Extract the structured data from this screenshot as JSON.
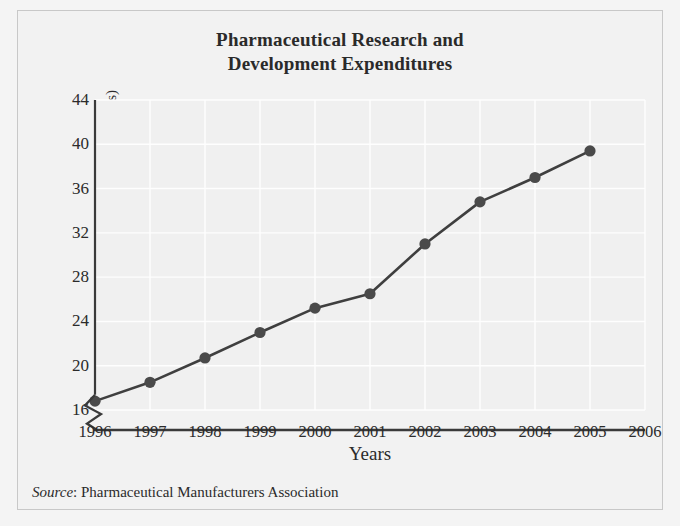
{
  "figure": {
    "title_line1": "Pharmaceutical Research and",
    "title_line2": "Development Expenditures",
    "source_label": "Source",
    "source_sep": ": ",
    "source_text": "Pharmaceutical Manufacturers Association",
    "background_color": "#f2f2f2",
    "border_color": "#c8c8c8"
  },
  "axes": {
    "ylabel_main": "Dollars",
    "ylabel_paren": " (in billions)",
    "xlabel": "Years",
    "y_ticks": [
      "16",
      "20",
      "24",
      "28",
      "32",
      "36",
      "40",
      "44"
    ],
    "x_ticks": [
      "1996",
      "1997",
      "1998",
      "1999",
      "2000",
      "2001",
      "2002",
      "2003",
      "2004",
      "2005",
      "2006"
    ],
    "axis_break": true,
    "axis_color": "#3a3a3a",
    "gridline_color": "#ffffff"
  },
  "chart_data": {
    "type": "line",
    "title": "Pharmaceutical Research and Development Expenditures",
    "xlabel": "Years",
    "ylabel": "Dollars (in billions)",
    "x": [
      1996,
      1997,
      1998,
      1999,
      2000,
      2001,
      2002,
      2003,
      2004,
      2005
    ],
    "values": [
      16.8,
      18.5,
      20.7,
      23.0,
      25.2,
      26.5,
      31.0,
      34.8,
      37.0,
      39.4
    ],
    "categories": [
      "1996",
      "1997",
      "1998",
      "1999",
      "2000",
      "2001",
      "2002",
      "2003",
      "2004",
      "2005"
    ],
    "xlim": [
      1996,
      2006
    ],
    "ylim": [
      16,
      44
    ],
    "y_ticks": [
      16,
      20,
      24,
      28,
      32,
      36,
      40,
      44
    ],
    "x_ticks": [
      1996,
      1997,
      1998,
      1999,
      2000,
      2001,
      2002,
      2003,
      2004,
      2005,
      2006
    ],
    "grid": true,
    "legend": false,
    "marker": "circle",
    "marker_color": "#4a4a4a",
    "line_color": "#3f3f3f",
    "y_axis_break": true,
    "source": "Source: Pharmaceutical Manufacturers Association"
  }
}
